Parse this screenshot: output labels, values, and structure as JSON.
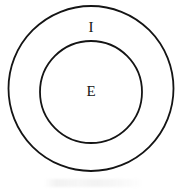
{
  "diagram": {
    "type": "euler-diagram",
    "background_color": "#ffffff",
    "stroke_color": "#141414",
    "stroke_width": 1.8,
    "fill_color": "none",
    "shapes": [
      {
        "id": "outer-circle",
        "name": "outer-set-circle",
        "shape": "circle",
        "cx": 91,
        "cy": 88.5,
        "r": 82.5
      },
      {
        "id": "inner-circle",
        "name": "inner-set-circle",
        "shape": "circle",
        "cx": 91,
        "cy": 92,
        "r": 51
      }
    ],
    "labels": [
      {
        "id": "outer-label",
        "text": "I",
        "region": "annulus",
        "x": 91,
        "y": 27,
        "font_size": 15,
        "color": "#141414"
      },
      {
        "id": "inner-label",
        "text": "E",
        "region": "inner-disc",
        "x": 91,
        "y": 91,
        "font_size": 15,
        "color": "#141414"
      }
    ]
  }
}
